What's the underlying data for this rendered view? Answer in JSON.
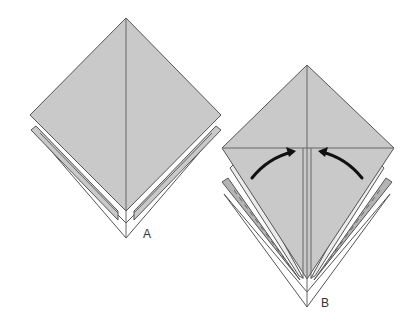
{
  "colors": {
    "background": "#ffffff",
    "paper_gray": "#c9c9c9",
    "paper_gray_dark": "#b4b4b4",
    "paper_light": "#ececec",
    "paper_white": "#ffffff",
    "stroke": "#555555",
    "crease": "#666666",
    "arrow": "#111111"
  },
  "figures": [
    {
      "id": "A",
      "label": "A",
      "label_pos": [
        143,
        228
      ],
      "polygons": [
        {
          "name": "back-layer-white",
          "points": "34,131 126,238 218,131 126,223",
          "fill": "paper_white"
        },
        {
          "name": "middle-layer-left",
          "points": "31,130 118,220 118,211 36,126",
          "fill": "paper_gray"
        },
        {
          "name": "middle-layer-right",
          "points": "221,130 134,220 134,211 216,126",
          "fill": "paper_gray"
        },
        {
          "name": "front-diamond",
          "points": "126,18 221,115 126,211 30,115",
          "fill": "paper_gray"
        }
      ],
      "lines": [
        {
          "name": "center-crease",
          "x1": 126,
          "y1": 18,
          "x2": 126,
          "y2": 238
        },
        {
          "name": "inner-edge-left",
          "x1": 40,
          "y1": 133,
          "x2": 118,
          "y2": 213
        },
        {
          "name": "inner-edge-right",
          "x1": 212,
          "y1": 133,
          "x2": 134,
          "y2": 213
        }
      ]
    },
    {
      "id": "B",
      "label": "B",
      "label_pos": [
        321,
        297
      ],
      "polygons": [
        {
          "name": "back-layer-white",
          "points": "224,194 307,307 390,194 307,292",
          "fill": "paper_white"
        },
        {
          "name": "gray-flap-left",
          "points": "222,182 296,275 300,280 228,178",
          "fill": "paper_gray_dark"
        },
        {
          "name": "gray-flap-right",
          "points": "392,182 318,275 314,280 386,178",
          "fill": "paper_gray_dark"
        },
        {
          "name": "light-flap-left",
          "points": "230,168 299,276 303,278 238,160",
          "fill": "paper_light"
        },
        {
          "name": "light-flap-right",
          "points": "384,168 315,276 311,278 376,160",
          "fill": "paper_light"
        },
        {
          "name": "front-kite",
          "points": "307,65 394,148 307,279 222,148",
          "fill": "paper_gray"
        }
      ],
      "lines": [
        {
          "name": "center-crease",
          "x1": 307,
          "y1": 65,
          "x2": 307,
          "y2": 307
        },
        {
          "name": "horizontal-fold-line",
          "x1": 222,
          "y1": 148,
          "x2": 394,
          "y2": 148
        },
        {
          "name": "inner-fold-left",
          "x1": 303,
          "y1": 148,
          "x2": 303,
          "y2": 279
        },
        {
          "name": "inner-fold-right",
          "x1": 311,
          "y1": 148,
          "x2": 311,
          "y2": 279
        }
      ],
      "dashed_lines": [
        {
          "name": "dashed-fold-left",
          "x1": 234,
          "y1": 190,
          "x2": 294,
          "y2": 272
        },
        {
          "name": "dashed-fold-right",
          "x1": 380,
          "y1": 190,
          "x2": 320,
          "y2": 272
        }
      ],
      "arrows": [
        {
          "name": "fold-arrow-left",
          "d": "M252,178 Q268,158 292,152",
          "head": "296,151 286,147 289,157"
        },
        {
          "name": "fold-arrow-right",
          "d": "M362,178 Q346,158 322,152",
          "head": "318,151 328,147 325,157"
        }
      ]
    }
  ]
}
